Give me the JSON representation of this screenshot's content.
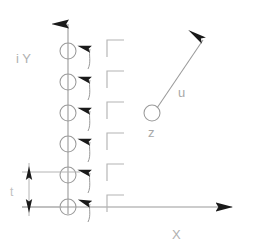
{
  "figure": {
    "type": "technical-diagram",
    "background_color": "#ffffff",
    "line_color": "#9a9a9a",
    "arrowhead_color": "#1a1a1a",
    "label_color": "#b0b0b0",
    "canvas": {
      "width": 258,
      "height": 252
    }
  },
  "axes": {
    "y_axis": {
      "label": "i Y",
      "label_x": 16,
      "label_y": 63,
      "x": 68,
      "y_top": 14,
      "y_bottom": 214,
      "arrow": "up"
    },
    "x_axis": {
      "label": "X",
      "label_x": 172,
      "label_y": 239,
      "y": 207,
      "x_left": 22,
      "x_right": 242,
      "arrow": "right"
    }
  },
  "circles": {
    "name": "vortex-markers",
    "radius": 8,
    "cx": 68,
    "cy_list": [
      51,
      82,
      113,
      144,
      175,
      207
    ]
  },
  "small_arrows": {
    "name": "flow-arrow-column",
    "count": 6,
    "x": 90,
    "y_tip_list": [
      43,
      74,
      105,
      136,
      167,
      198
    ],
    "length": 26,
    "direction": "up"
  },
  "brackets": {
    "name": "corner-bracket-column",
    "count": 6,
    "x": 107,
    "y_list": [
      40,
      71,
      102,
      133,
      164,
      195
    ],
    "width": 17,
    "height": 17,
    "shape": "top-left-corner"
  },
  "vector_u": {
    "label": "u",
    "label_x": 178,
    "label_y": 97,
    "origin_label": "z",
    "origin_label_x": 148,
    "origin_label_y": 137,
    "origin_x": 152,
    "origin_y": 113,
    "origin_radius": 8,
    "tip_x": 206,
    "tip_y": 32,
    "arrow": "up-right"
  },
  "dimension": {
    "label": "t",
    "label_x": 10,
    "label_y": 196,
    "line_x": 29,
    "y_top": 172,
    "y_bottom": 207,
    "ext_line_x_start": 22,
    "ext_line_x_end": 80,
    "arrows": "both"
  }
}
